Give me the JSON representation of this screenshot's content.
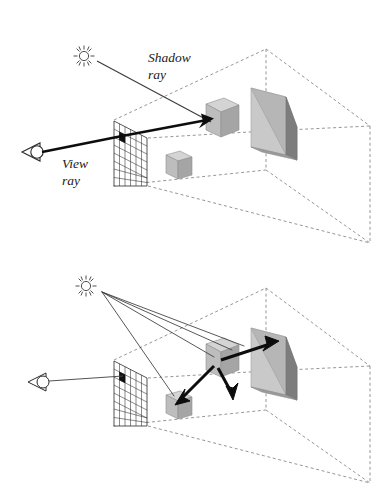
{
  "figure": {
    "panels": [
      {
        "id": "whitted-ray-tracing",
        "name": "Direct illumination ray tracing",
        "labels": [
          {
            "name": "shadow-ray-label",
            "line1": "Shadow",
            "line2": "ray",
            "x": 148,
            "y": 60
          },
          {
            "name": "view-ray-label",
            "line1": "View",
            "line2": "ray",
            "x": 62,
            "y": 166
          }
        ],
        "icons": {
          "light_source": "sun-icon",
          "camera": "eye-icon"
        },
        "rays": {
          "view_ray_count": 1,
          "shadow_ray_count": 1,
          "bounce_ray_count": 0
        }
      },
      {
        "id": "global-illumination-ray-tracing",
        "name": "Global illumination ray tracing",
        "labels": [],
        "icons": {
          "light_source": "sun-icon",
          "camera": "eye-icon"
        },
        "rays": {
          "view_ray_count": 1,
          "shadow_ray_count": 4,
          "bounce_ray_count": 3
        }
      }
    ],
    "objects": [
      {
        "name": "image-plane-grid",
        "columns": 5,
        "rows": 6,
        "highlighted_pixel": "row-2-col-1"
      },
      {
        "name": "cube-large",
        "faces": 3
      },
      {
        "name": "cube-small",
        "faces": 3
      },
      {
        "name": "wedge-prism",
        "faces": 3
      },
      {
        "name": "scene-box",
        "style": "dashed"
      }
    ],
    "colors": {
      "stroke": "#1a1a1a",
      "dashed": "#7a7a7a",
      "ray_thin": "#4a4a4a",
      "face_top": "#d2d2d2",
      "face_front": "#c9c9c9",
      "face_side": "#9a9a9a",
      "face_dark": "#6e6e6e",
      "background": "#ffffff"
    }
  }
}
